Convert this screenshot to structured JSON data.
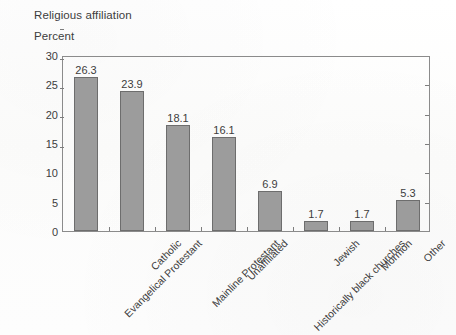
{
  "chart_data": {
    "type": "bar",
    "title": "Religious affiliation",
    "ylabel": "Percent",
    "xlabel": "",
    "ylim": [
      0,
      30
    ],
    "yticks": [
      0,
      5,
      10,
      15,
      20,
      25,
      30
    ],
    "grid": false,
    "legend": null,
    "categories": [
      "Evangelical Protestant",
      "Catholic",
      "Mainline Protestant",
      "Unaffiliated",
      "Historically black churches",
      "Jewish",
      "Mormon",
      "Other"
    ],
    "values": [
      26.3,
      23.9,
      18.1,
      16.1,
      6.9,
      1.7,
      1.7,
      5.3
    ],
    "value_labels": [
      "26.3",
      "23.9",
      "18.1",
      "16.1",
      "6.9",
      "1.7",
      "1.7",
      "5.3"
    ],
    "bar_color": "#9c9c9c",
    "bar_edge_color": "#6d6d6d",
    "axis_color": "#8b8b8b",
    "text_color": "#3d3d3d",
    "background": "#fdfdfc"
  }
}
